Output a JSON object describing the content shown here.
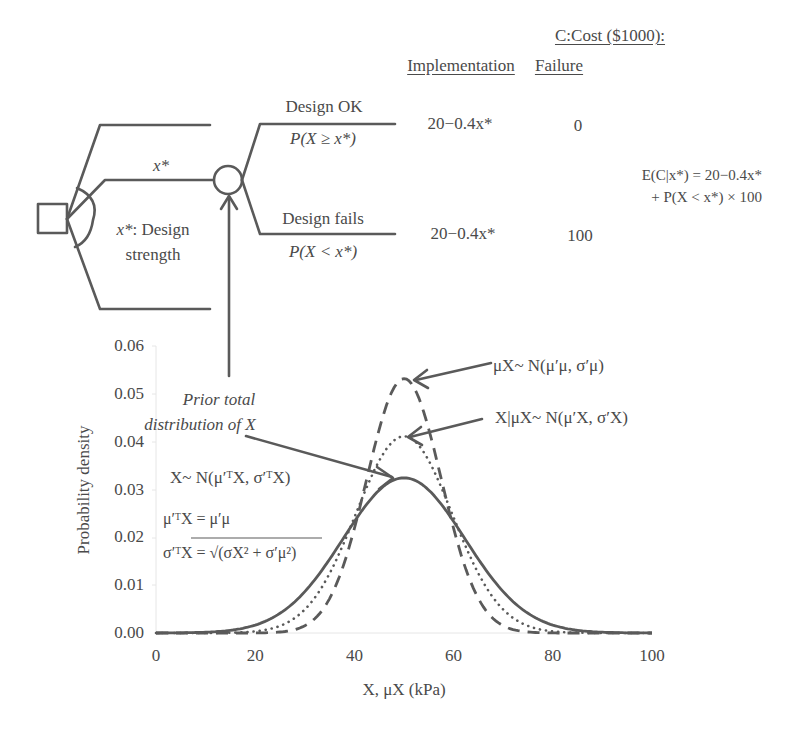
{
  "header": {
    "cost_title": "C:Cost ($1000):",
    "col_implementation": "Implementation",
    "col_failure": "Failure"
  },
  "tree": {
    "decision_label": "x*: Design strength",
    "decision_label_line1_var": "x*",
    "decision_label_line1_text": ": Design",
    "decision_label_line2": "strength",
    "branch_label": "x*",
    "outcomes": [
      {
        "label": "Design OK",
        "prob": "P(X ≥ x*)",
        "implementation": "20−0.4x*",
        "failure": "0"
      },
      {
        "label": "Design fails",
        "prob": "P(X < x*)",
        "implementation": "20−0.4x*",
        "failure": "100"
      }
    ],
    "expected_cost_line1": "E(C|x*) = 20−0.4x*",
    "expected_cost_line2": "+ P(X < x*) × 100"
  },
  "annotations": {
    "prior_total_line1": "Prior total",
    "prior_total_line2": "distribution of X",
    "dist_total": "X~ N(μ′ᵀX, σ′ᵀX)",
    "mean_total": "μ′ᵀX = μ′μ",
    "sigma_total": "σ′ᵀX = √(σX² + σ′μ²)",
    "dist_mu": "μX~ N(μ′μ, σ′μ)",
    "dist_conditional": "X|μX~ N(μ′X, σ′X)"
  },
  "chart_data": {
    "type": "line",
    "title": "",
    "xlabel": "X, μX (kPa)",
    "ylabel": "Probability density",
    "xlim": [
      0,
      100
    ],
    "ylim": [
      0,
      0.06
    ],
    "xticks": [
      "0",
      "20",
      "40",
      "60",
      "80",
      "100"
    ],
    "yticks": [
      "0.00",
      "0.01",
      "0.02",
      "0.03",
      "0.04",
      "0.05",
      "0.06"
    ],
    "grid": false,
    "legend": "none (curves labeled by arrows)",
    "x": [
      0,
      10,
      20,
      25,
      30,
      35,
      40,
      45,
      50,
      55,
      60,
      65,
      70,
      75,
      80,
      90,
      100
    ],
    "series": [
      {
        "name": "X~N(μ′ᵀX,σ′ᵀX) prior total",
        "style": "solid",
        "mean": 50,
        "sd": 12.3,
        "values": [
          0.0,
          0.0003,
          0.0017,
          0.004,
          0.0086,
          0.0153,
          0.0233,
          0.0298,
          0.0324,
          0.0298,
          0.0233,
          0.0153,
          0.0086,
          0.004,
          0.0017,
          0.0003,
          0.0
        ]
      },
      {
        "name": "X|μX~N(μ′X,σ′X)",
        "style": "dotted",
        "mean": 50,
        "sd": 9.7,
        "values": [
          0.0,
          0.0,
          0.0003,
          0.0015,
          0.0049,
          0.0125,
          0.0242,
          0.0361,
          0.0411,
          0.0361,
          0.0242,
          0.0125,
          0.0049,
          0.0015,
          0.0003,
          0.0,
          0.0
        ]
      },
      {
        "name": "μX~N(μ′μ,σ′μ)",
        "style": "dashed",
        "mean": 50,
        "sd": 7.5,
        "values": [
          0.0,
          0.0,
          0.0,
          0.0002,
          0.0015,
          0.0072,
          0.0219,
          0.0425,
          0.0532,
          0.0425,
          0.0219,
          0.0072,
          0.0015,
          0.0002,
          0.0,
          0.0,
          0.0
        ]
      }
    ]
  },
  "colors": {
    "ink": "#4a4a4a",
    "line": "#5a5a5a",
    "axis": "#e6e6e6"
  }
}
